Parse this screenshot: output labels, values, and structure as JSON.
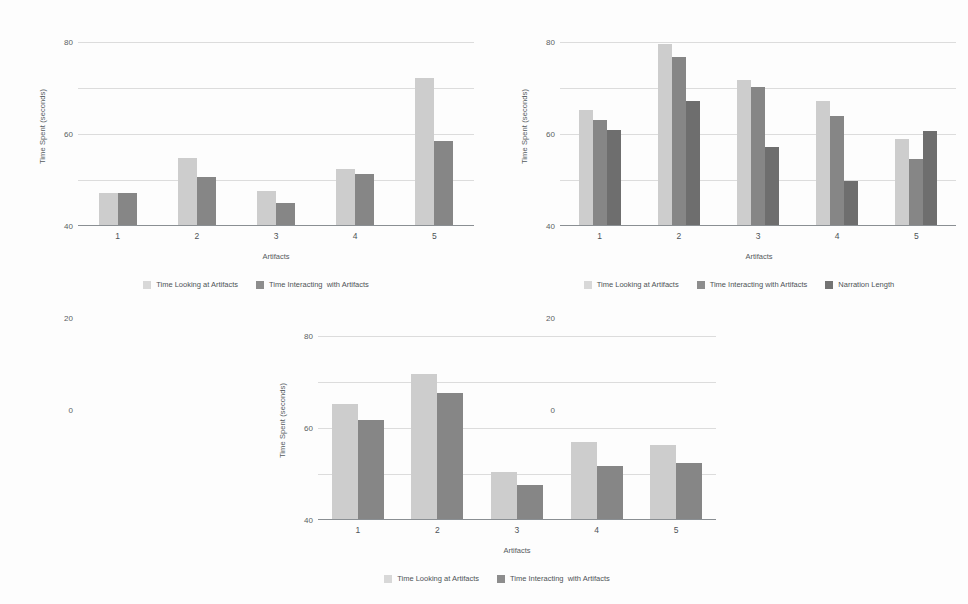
{
  "charts": [
    {
      "id": "chart-top-left",
      "ylabel": "Time Spent (seconds)",
      "xlabel": "Artifacts",
      "yticks": [
        "0",
        "20",
        "40",
        "60",
        "80"
      ],
      "categories": [
        "1",
        "2",
        "3",
        "4",
        "5"
      ],
      "legend": [
        "Time Looking at Artifacts",
        "Time Interacting  with Artifacts"
      ]
    },
    {
      "id": "chart-top-right",
      "ylabel": "Time Spent (seconds)",
      "xlabel": "Artifacts",
      "yticks": [
        "0",
        "20",
        "40",
        "60",
        "80"
      ],
      "categories": [
        "1",
        "2",
        "3",
        "4",
        "5"
      ],
      "legend": [
        "Time Looking at Artifacts",
        "Time Interacting with Artifacts",
        "Narration Length"
      ]
    },
    {
      "id": "chart-bottom",
      "ylabel": "Time Spent (seconds)",
      "xlabel": "Artifacts",
      "yticks": [
        "0",
        "20",
        "40",
        "60",
        "80"
      ],
      "categories": [
        "1",
        "2",
        "3",
        "4",
        "5"
      ],
      "legend": [
        "Time Looking at Artifacts",
        "Time Interacting  with Artifacts"
      ]
    }
  ],
  "colors": {
    "series_light": "#cdcdcd",
    "series_dark": "#868686",
    "series_darker": "#6e6e6e",
    "gridline": "#dcdcdc",
    "axis": "#8a8f93",
    "text": "#4e5357",
    "background": "#fdfdfd"
  },
  "chart_data": [
    {
      "type": "bar",
      "title": "",
      "xlabel": "Artifacts",
      "ylabel": "Time Spent (seconds)",
      "categories": [
        "1",
        "2",
        "3",
        "4",
        "5"
      ],
      "ylim": [
        0,
        80
      ],
      "yticks": [
        0,
        20,
        40,
        60,
        80
      ],
      "grid": true,
      "legend_position": "bottom",
      "series": [
        {
          "name": "Time Looking at Artifacts",
          "values": [
            14,
            29,
            15,
            24.5,
            64
          ]
        },
        {
          "name": "Time Interacting  with Artifacts",
          "values": [
            14,
            21,
            9.5,
            22,
            36.5
          ]
        }
      ]
    },
    {
      "type": "bar",
      "title": "",
      "xlabel": "Artifacts",
      "ylabel": "Time Spent (seconds)",
      "categories": [
        "1",
        "2",
        "3",
        "4",
        "5"
      ],
      "ylim": [
        0,
        80
      ],
      "yticks": [
        0,
        20,
        40,
        60,
        80
      ],
      "grid": true,
      "legend_position": "bottom",
      "series": [
        {
          "name": "Time Looking at Artifacts",
          "values": [
            50,
            78.5,
            63,
            54,
            37.5
          ]
        },
        {
          "name": "Time Interacting with Artifacts",
          "values": [
            45.5,
            73,
            60,
            47.5,
            28.5
          ]
        },
        {
          "name": "Narration Length",
          "values": [
            41.5,
            54,
            34,
            19,
            41
          ]
        }
      ]
    },
    {
      "type": "bar",
      "title": "",
      "xlabel": "Artifacts",
      "ylabel": "Time Spent (seconds)",
      "categories": [
        "1",
        "2",
        "3",
        "4",
        "5"
      ],
      "ylim": [
        0,
        80
      ],
      "yticks": [
        0,
        20,
        40,
        60,
        80
      ],
      "grid": true,
      "legend_position": "bottom",
      "series": [
        {
          "name": "Time Looking at Artifacts",
          "values": [
            50,
            63,
            20.5,
            33.5,
            32
          ]
        },
        {
          "name": "Time Interacting  with Artifacts",
          "values": [
            43,
            55,
            15,
            23,
            24.5
          ]
        }
      ]
    }
  ]
}
